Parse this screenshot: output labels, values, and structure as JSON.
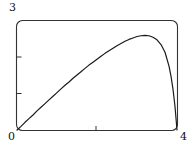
{
  "figure": {
    "background_color": "#ffffff",
    "line_color": "#1a1a1a",
    "frame_color": "#333333"
  },
  "labels": {
    "y_max": "3",
    "origin": "0",
    "x_max": "4"
  },
  "chart_data": {
    "type": "line",
    "title": "",
    "xlabel": "",
    "ylabel": "",
    "xlim": [
      0,
      4
    ],
    "ylim": [
      0,
      3
    ],
    "grid": false,
    "legend": null,
    "frame": "rounded-rectangle",
    "xticks": [
      0,
      2,
      4
    ],
    "xticklabels": [
      "0",
      "",
      "4"
    ],
    "yticks": [
      0,
      1,
      2,
      3
    ],
    "yticklabels": [
      "",
      "",
      "",
      "3"
    ],
    "series": [
      {
        "name": "curve",
        "x": [
          0.0,
          0.1,
          0.2,
          0.3,
          0.4,
          0.5,
          0.6,
          0.7,
          0.8,
          0.9,
          1.0,
          1.1,
          1.2,
          1.3,
          1.4,
          1.5,
          1.6,
          1.7,
          1.8,
          1.9,
          2.0,
          2.1,
          2.2,
          2.3,
          2.4,
          2.5,
          2.6,
          2.7,
          2.8,
          2.9,
          3.0,
          3.1,
          3.2,
          3.3,
          3.4,
          3.5,
          3.6,
          3.7,
          3.8,
          3.85,
          3.9,
          3.95,
          4.0
        ],
        "y": [
          0.0,
          0.1,
          0.21,
          0.31,
          0.41,
          0.52,
          0.62,
          0.72,
          0.82,
          0.92,
          1.02,
          1.12,
          1.22,
          1.31,
          1.41,
          1.5,
          1.59,
          1.68,
          1.77,
          1.85,
          1.93,
          2.01,
          2.09,
          2.16,
          2.23,
          2.3,
          2.36,
          2.42,
          2.47,
          2.51,
          2.55,
          2.57,
          2.58,
          2.57,
          2.53,
          2.46,
          2.33,
          2.12,
          1.74,
          1.47,
          1.11,
          0.64,
          0.0
        ]
      }
    ]
  }
}
